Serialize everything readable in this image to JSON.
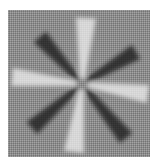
{
  "image": {
    "description": "Grayscale starburst stimulus: light vertical/horizontal rays and dark diagonal rays on a gray dithered square",
    "background_color": "#8c8c8c",
    "light_ray_color": "#f0f0f0",
    "dark_ray_color": "#151515",
    "center": [
      74,
      74
    ],
    "light_rays": [
      {
        "name": "up",
        "tip": [
          78,
          8
        ],
        "width": 20
      },
      {
        "name": "down",
        "tip": [
          66,
          142
        ],
        "width": 20
      },
      {
        "name": "left",
        "tip": [
          4,
          67
        ],
        "width": 18
      },
      {
        "name": "right",
        "tip": [
          140,
          84
        ],
        "width": 18
      }
    ],
    "dark_rays": [
      {
        "name": "nw",
        "tip": [
          32,
          27
        ],
        "width": 16
      },
      {
        "name": "ne",
        "tip": [
          128,
          42
        ],
        "width": 16
      },
      {
        "name": "sw",
        "tip": [
          24,
          118
        ],
        "width": 16
      },
      {
        "name": "se",
        "tip": [
          118,
          128
        ],
        "width": 16
      }
    ]
  }
}
